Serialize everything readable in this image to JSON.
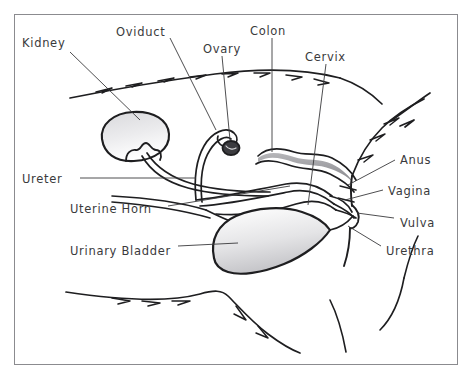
{
  "figure": {
    "style": "hand-drawn pencil sketch",
    "border_color": "#8b8b8f",
    "ink_color": "#1e1e20",
    "label_color": "#3a3a3c",
    "shade_color": "#b9b9bc",
    "background": "#ffffff"
  },
  "labels": {
    "kidney": "Kidney",
    "oviduct": "Oviduct",
    "ovary": "Ovary",
    "colon": "Colon",
    "cervix": "Cervix",
    "anus": "Anus",
    "vagina": "Vagina",
    "vulva": "Vulva",
    "urethra": "Urethra",
    "ureter": "Ureter",
    "uterine_horn": "Uterine Horn",
    "urinary_bladder": "Urinary Bladder"
  },
  "label_positions": {
    "kidney": {
      "x": 22,
      "y": 38,
      "align": "left"
    },
    "oviduct": {
      "x": 116,
      "y": 27,
      "align": "left"
    },
    "ovary": {
      "x": 203,
      "y": 44,
      "align": "left"
    },
    "colon": {
      "x": 250,
      "y": 26,
      "align": "left"
    },
    "cervix": {
      "x": 305,
      "y": 52,
      "align": "left"
    },
    "anus": {
      "x": 400,
      "y": 155,
      "align": "left"
    },
    "vagina": {
      "x": 388,
      "y": 186,
      "align": "left"
    },
    "vulva": {
      "x": 400,
      "y": 218,
      "align": "left"
    },
    "urethra": {
      "x": 386,
      "y": 246,
      "align": "left"
    },
    "ureter": {
      "x": 22,
      "y": 174,
      "align": "left"
    },
    "uterine_horn": {
      "x": 70,
      "y": 204,
      "align": "left"
    },
    "urinary_bladder": {
      "x": 70,
      "y": 246,
      "align": "left"
    }
  },
  "leader_lines": [
    {
      "name": "kidney-leader",
      "x1": 70,
      "y1": 52,
      "x2": 140,
      "y2": 120
    },
    {
      "name": "oviduct-leader",
      "x1": 170,
      "y1": 38,
      "x2": 216,
      "y2": 130
    },
    {
      "name": "ovary-leader",
      "x1": 222,
      "y1": 56,
      "x2": 230,
      "y2": 140
    },
    {
      "name": "colon-leader",
      "x1": 272,
      "y1": 38,
      "x2": 272,
      "y2": 152
    },
    {
      "name": "cervix-leader",
      "x1": 326,
      "y1": 64,
      "x2": 308,
      "y2": 205
    },
    {
      "name": "anus-leader",
      "x1": 395,
      "y1": 160,
      "x2": 348,
      "y2": 185
    },
    {
      "name": "vagina-leader",
      "x1": 383,
      "y1": 190,
      "x2": 345,
      "y2": 200
    },
    {
      "name": "vulva-leader",
      "x1": 394,
      "y1": 218,
      "x2": 357,
      "y2": 213
    },
    {
      "name": "urethra-leader",
      "x1": 381,
      "y1": 246,
      "x2": 348,
      "y2": 226
    },
    {
      "name": "ureter-leader",
      "x1": 80,
      "y1": 178,
      "x2": 196,
      "y2": 178
    },
    {
      "name": "uterine-horn-leader",
      "x1": 168,
      "y1": 206,
      "x2": 290,
      "y2": 186
    },
    {
      "name": "urinary-bladder-leader",
      "x1": 178,
      "y1": 246,
      "x2": 238,
      "y2": 243
    }
  ],
  "organs": [
    {
      "name": "kidney",
      "shape": "bean-oval",
      "shaded": true
    },
    {
      "name": "ureter",
      "shape": "double-tube",
      "shaded": false
    },
    {
      "name": "ovary",
      "shape": "small-oval",
      "shaded": true
    },
    {
      "name": "oviduct",
      "shape": "coiled-tube",
      "shaded": false
    },
    {
      "name": "uterine-horn",
      "shape": "double-tube",
      "shaded": false
    },
    {
      "name": "colon",
      "shape": "wavy-tube",
      "shaded": true
    },
    {
      "name": "urinary-bladder",
      "shape": "teardrop",
      "shaded": true
    },
    {
      "name": "cervix",
      "shape": "junction",
      "shaded": false
    },
    {
      "name": "vagina",
      "shape": "tube",
      "shaded": false
    },
    {
      "name": "body-outline",
      "shape": "contour",
      "shaded": false
    }
  ]
}
